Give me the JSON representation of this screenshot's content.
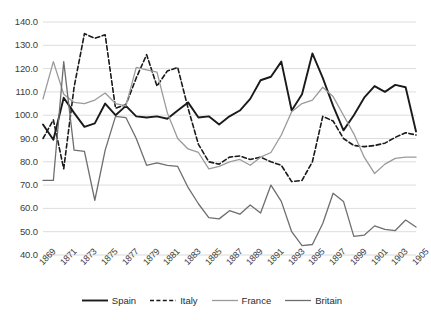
{
  "chart_data": {
    "type": "line",
    "title": "",
    "subtitle": "",
    "xlabel": "",
    "ylabel": "",
    "xlim": [
      1869,
      1905
    ],
    "ylim": [
      40.0,
      140.0
    ],
    "grid": true,
    "legend_position": "bottom",
    "y_ticks": [
      "140.0",
      "130.0",
      "120.0",
      "110.0",
      "100.0",
      "90.0",
      "80.0",
      "70.0",
      "60.0",
      "50.0",
      "40.0"
    ],
    "y_tick_values": [
      140,
      130,
      120,
      110,
      100,
      90,
      80,
      70,
      60,
      50,
      40
    ],
    "x_tick_labels": [
      "1869",
      "1871",
      "1873",
      "1875",
      "1877",
      "1879",
      "1881",
      "1883",
      "1885",
      "1887",
      "1889",
      "1891",
      "1893",
      "1895",
      "1897",
      "1899",
      "1901",
      "1903",
      "1905"
    ],
    "x": [
      1869,
      1870,
      1871,
      1872,
      1873,
      1874,
      1875,
      1876,
      1877,
      1878,
      1879,
      1880,
      1881,
      1882,
      1883,
      1884,
      1885,
      1886,
      1887,
      1888,
      1889,
      1890,
      1891,
      1892,
      1893,
      1894,
      1895,
      1896,
      1897,
      1898,
      1899,
      1900,
      1901,
      1902,
      1903,
      1904,
      1905
    ],
    "series": [
      {
        "name": "Spain",
        "color": "#1a1a1a",
        "style": "solid",
        "width": 1.9,
        "values": [
          96.0,
          89.5,
          107.5,
          101.0,
          95.0,
          96.5,
          105.0,
          100.0,
          104.0,
          99.5,
          99.0,
          99.5,
          98.5,
          102.0,
          105.5,
          99.0,
          99.5,
          96.0,
          99.5,
          102.0,
          107.0,
          115.0,
          116.5,
          123.0,
          102.0,
          109.0,
          126.5,
          116.0,
          104.0,
          93.5,
          100.0,
          107.5,
          112.5,
          110.0,
          113.0,
          112.0,
          93.0
        ]
      },
      {
        "name": "Italy",
        "color": "#1a1a1a",
        "style": "dashed",
        "width": 1.6,
        "values": [
          90.0,
          98.0,
          77.0,
          112.0,
          135.0,
          133.0,
          134.5,
          103.0,
          104.5,
          116.0,
          126.0,
          112.5,
          119.0,
          120.5,
          103.0,
          87.5,
          80.0,
          79.0,
          82.0,
          82.5,
          81.0,
          82.0,
          80.0,
          78.5,
          71.5,
          72.0,
          80.0,
          99.5,
          97.5,
          90.0,
          87.0,
          86.5,
          87.0,
          88.0,
          90.5,
          92.5,
          91.5
        ]
      },
      {
        "name": "France",
        "color": "#9a9a9a",
        "style": "solid",
        "width": 1.3,
        "values": [
          107.0,
          123.0,
          109.0,
          105.5,
          105.0,
          106.5,
          109.5,
          105.0,
          104.0,
          120.5,
          119.5,
          118.5,
          101.0,
          90.0,
          85.5,
          84.0,
          77.0,
          78.0,
          80.0,
          81.0,
          78.5,
          82.0,
          84.0,
          91.5,
          101.5,
          105.0,
          106.5,
          112.0,
          108.0,
          100.0,
          92.0,
          82.0,
          75.0,
          79.0,
          81.5,
          82.0,
          82.0
        ]
      },
      {
        "name": "Britain",
        "color": "#6e6e6e",
        "style": "solid",
        "width": 1.3,
        "values": [
          72.0,
          72.0,
          123.0,
          85.0,
          84.5,
          63.5,
          85.0,
          99.5,
          99.0,
          90.0,
          78.5,
          79.5,
          78.5,
          78.0,
          69.0,
          62.0,
          56.0,
          55.5,
          59.0,
          57.5,
          61.5,
          58.0,
          70.0,
          63.0,
          50.0,
          44.0,
          44.5,
          53.5,
          66.5,
          63.0,
          48.0,
          48.5,
          52.5,
          51.0,
          50.5,
          55.0,
          52.0
        ]
      }
    ]
  },
  "legend": {
    "items": [
      {
        "label": "Spain",
        "icon": "solid-line-swatch"
      },
      {
        "label": "Italy",
        "icon": "dashed-line-swatch"
      },
      {
        "label": "France",
        "icon": "solid-line-swatch"
      },
      {
        "label": "Britain",
        "icon": "solid-line-swatch"
      }
    ]
  },
  "colors": {
    "background": "#ffffff",
    "gridline": "#d9d9d9",
    "axis_text": "#404040",
    "spain": "#1a1a1a",
    "italy": "#1a1a1a",
    "france": "#9a9a9a",
    "britain": "#6e6e6e"
  }
}
